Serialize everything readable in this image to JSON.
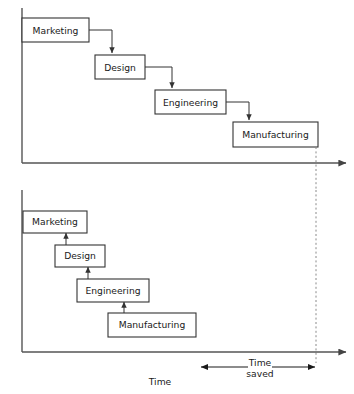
{
  "figure": {
    "charts": [
      {
        "id": "sequential",
        "name": "Sequential development (top)",
        "stages": [
          {
            "label": "Marketing",
            "x": 22,
            "y": 18,
            "w": 67,
            "h": 24
          },
          {
            "label": "Design",
            "x": 95,
            "y": 55,
            "w": 50,
            "h": 24
          },
          {
            "label": "Engineering",
            "x": 155,
            "y": 90,
            "w": 71,
            "h": 24
          },
          {
            "label": "Manufacturing",
            "x": 233,
            "y": 122,
            "w": 85,
            "h": 25
          }
        ],
        "axis": {
          "origin_x": 22,
          "top_y": 8,
          "baseline_y": 163,
          "arrow_x": 348
        }
      },
      {
        "id": "concurrent",
        "name": "Concurrent development (bottom)",
        "stages": [
          {
            "label": "Marketing",
            "x": 23,
            "y": 211,
            "w": 64,
            "h": 22
          },
          {
            "label": "Design",
            "x": 55,
            "y": 245,
            "w": 50,
            "h": 22
          },
          {
            "label": "Engineering",
            "x": 77,
            "y": 279,
            "w": 72,
            "h": 23
          },
          {
            "label": "Manufacturing",
            "x": 108,
            "y": 313,
            "w": 88,
            "h": 24
          }
        ],
        "axis": {
          "origin_x": 22,
          "top_y": 190,
          "baseline_y": 352,
          "arrow_x": 348
        }
      }
    ],
    "annotations": {
      "time_saved_line1": "Time",
      "time_saved_line2": "saved",
      "time_axis_label": "Time"
    },
    "markers": {
      "dashed_guide_x": 316,
      "time_saved_left_x": 200,
      "time_saved_right_x": 316,
      "time_saved_y": 367
    },
    "colors": {
      "box_stroke": "#333333",
      "box_fill": "#ffffff",
      "axis": "#555555",
      "dashed": "#8a8a8a",
      "text": "#1a1a1a"
    }
  }
}
